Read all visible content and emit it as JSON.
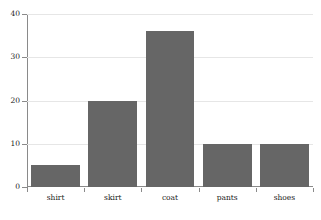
{
  "chart_data": {
    "type": "bar",
    "title": "",
    "subtitle": "",
    "xlabel": "",
    "ylabel": "",
    "categories": [
      "shirt",
      "skirt",
      "coat",
      "pants",
      "shoes"
    ],
    "values": [
      5,
      20,
      36,
      10,
      10
    ],
    "ylim": [
      0,
      40
    ],
    "yticks": [
      0,
      10,
      20,
      30,
      40
    ],
    "ytick_labels": [
      "0",
      "10",
      "20",
      "30",
      "40"
    ],
    "grid": true,
    "grid_axis": "y",
    "legend": false,
    "legend_position": "none",
    "annotations": [],
    "colors": {
      "bar": "#666666",
      "background": "#ffffff",
      "gridline": "#e6e6e6",
      "axis": "#8a8a8a",
      "text": "#1a1a1a"
    }
  }
}
